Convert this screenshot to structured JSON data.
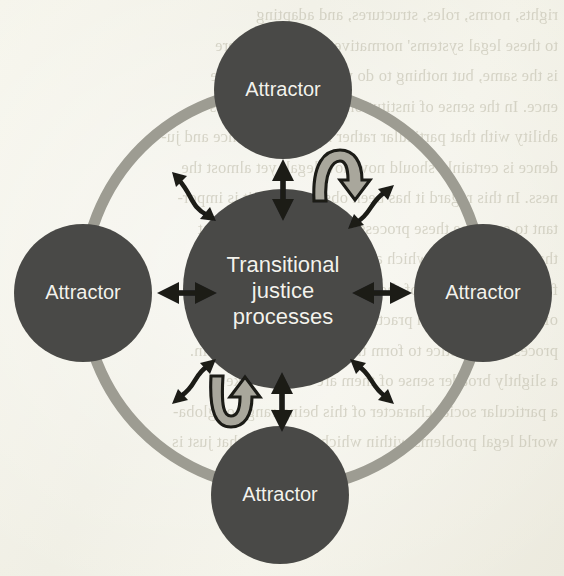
{
  "figure": {
    "type": "concept-diagram",
    "background_color": "#f2f1e6",
    "node_fill": "#4a4a46",
    "node_text_color": "#f3f2ec",
    "ring_color": "#9d9c92",
    "arrow_color": "#1a1a18",
    "curved_arrow_fill": "#a9a79c",
    "curved_arrow_stroke": "#1a1a18"
  },
  "center": {
    "name": "transitional-justice-processes",
    "label_line1": "Transitional",
    "label_line2": "justice",
    "label_line3": "processes",
    "cx": 283,
    "cy": 289,
    "r": 100
  },
  "ring": {
    "name": "attractor-ring",
    "cx": 283,
    "cy": 289,
    "r": 200,
    "stroke_width": 11
  },
  "attractors": [
    {
      "name": "attractor-top",
      "label": "Attractor",
      "cx": 283,
      "cy": 90,
      "r": 69,
      "position": "top"
    },
    {
      "name": "attractor-right",
      "label": "Attractor",
      "cx": 483,
      "cy": 293,
      "r": 69,
      "position": "right"
    },
    {
      "name": "attractor-bottom",
      "label": "Attractor",
      "cx": 280,
      "cy": 495,
      "r": 69,
      "position": "bottom"
    },
    {
      "name": "attractor-left",
      "label": "Attractor",
      "cx": 83,
      "cy": 293,
      "r": 69,
      "position": "left"
    }
  ],
  "straight_arrows": [
    {
      "name": "arrow-center-top",
      "orientation": "vertical",
      "double_headed": true
    },
    {
      "name": "arrow-center-right",
      "orientation": "horizontal",
      "double_headed": true
    },
    {
      "name": "arrow-center-bottom",
      "orientation": "vertical",
      "double_headed": true
    },
    {
      "name": "arrow-center-left",
      "orientation": "horizontal",
      "double_headed": true
    }
  ],
  "wavy_arrows": [
    {
      "name": "wavy-arrow-upper-left",
      "double_headed": true
    },
    {
      "name": "wavy-arrow-upper-right",
      "double_headed": true
    },
    {
      "name": "wavy-arrow-lower-right",
      "double_headed": true
    },
    {
      "name": "wavy-arrow-lower-left",
      "double_headed": true
    }
  ],
  "curved_arrows": [
    {
      "name": "curved-feedback-arrow-top",
      "shape": "arc-over-pointing-down"
    },
    {
      "name": "curved-feedback-arrow-bottom",
      "shape": "u-turn-pointing-up"
    }
  ],
  "ghost_text_lines": [
    "rights, norms, roles, structures, and adapting",
    "to these legal systems' normative behaviour. There",
    "is the same, but nothing to do with it the same time",
    "ence. In the sense of institutional between legal sys-",
    "ability with that particular rather regulated balance and ju-",
    "dence is certainly should now how legal, yet almost the",
    "ness. In this regard it has been observed that it is impor-",
    "tant to examine these processes as one of the consent",
    "that legal systems, which are often institutional",
    "from the interaction of them between the state",
    "of those processes in practical terms into a presenta-",
    "processes as justice to form the law at a certain outlin.",
    "a slightly broader sense of them are thus the take",
    "a particular social character of this being range of globa-",
    "world legal problems within which the justice that just is"
  ]
}
